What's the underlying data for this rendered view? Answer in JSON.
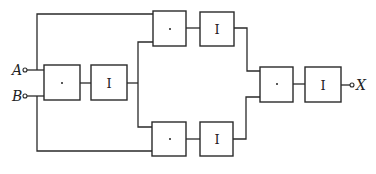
{
  "diagram": {
    "type": "logic-block-diagram",
    "inputs": [
      {
        "id": "A",
        "label": "A"
      },
      {
        "id": "B",
        "label": "B"
      }
    ],
    "output": {
      "id": "X",
      "label": "X"
    },
    "blocks": [
      {
        "id": "and1",
        "label": "·",
        "kind": "AND"
      },
      {
        "id": "inv1",
        "label": "I",
        "kind": "inverter"
      },
      {
        "id": "and2",
        "label": "·",
        "kind": "AND"
      },
      {
        "id": "inv2",
        "label": "I",
        "kind": "inverter"
      },
      {
        "id": "and3",
        "label": "·",
        "kind": "AND"
      },
      {
        "id": "inv3",
        "label": "I",
        "kind": "inverter"
      },
      {
        "id": "and4",
        "label": "·",
        "kind": "AND"
      },
      {
        "id": "inv4",
        "label": "I",
        "kind": "inverter"
      }
    ],
    "connections": [
      [
        "A",
        "and1"
      ],
      [
        "B",
        "and1"
      ],
      [
        "and1",
        "inv1"
      ],
      [
        "A",
        "and2"
      ],
      [
        "inv1",
        "and2"
      ],
      [
        "and2",
        "inv2"
      ],
      [
        "inv1",
        "and3"
      ],
      [
        "B",
        "and3"
      ],
      [
        "and3",
        "inv3"
      ],
      [
        "inv2",
        "and4"
      ],
      [
        "inv3",
        "and4"
      ],
      [
        "and4",
        "inv4"
      ],
      [
        "inv4",
        "X"
      ]
    ]
  }
}
